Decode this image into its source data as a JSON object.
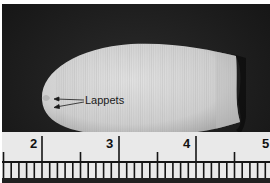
{
  "image": {
    "subject": "cylindrical larval/pupal specimen with ring striations photographed against dark background above a ruler",
    "colors": {
      "background": "#1e1e1e",
      "specimen": "#d6d6d6",
      "ruler": "#e9e9e9",
      "ink": "#111111"
    }
  },
  "annotation": {
    "label": "Lappets",
    "arrow_count": 2
  },
  "ruler": {
    "labels": [
      "2",
      "3",
      "4",
      "5"
    ],
    "major_tick_x": [
      42,
      119,
      196,
      270
    ],
    "half_tick_x": [
      5,
      81,
      158,
      235
    ],
    "minor_spacing_px": 7.7
  }
}
